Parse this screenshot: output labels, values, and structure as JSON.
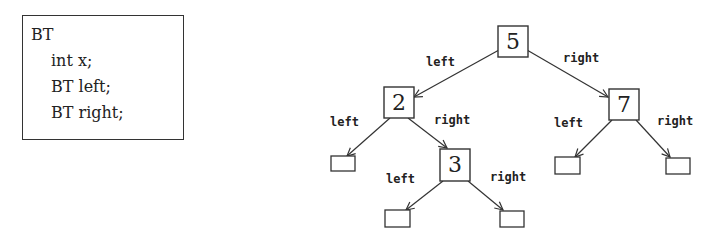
{
  "code_block": {
    "lines": [
      "BT",
      "int x;",
      "BT left;",
      "BT right;"
    ]
  },
  "tree": {
    "nodes": [
      {
        "id": "n5",
        "value": "5"
      },
      {
        "id": "n2",
        "value": "2"
      },
      {
        "id": "n7",
        "value": "7"
      },
      {
        "id": "n3",
        "value": "3"
      }
    ],
    "edge_labels": {
      "left": "left",
      "right": "right"
    }
  }
}
